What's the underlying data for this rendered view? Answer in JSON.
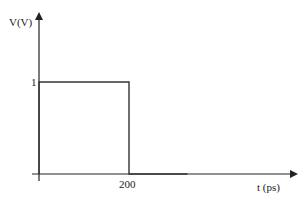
{
  "chart_data": {
    "type": "line",
    "title": "",
    "xlabel": "t (ps)",
    "ylabel": "V(V)",
    "x_ticks": [
      {
        "value": 200,
        "label": "200"
      }
    ],
    "y_ticks": [
      {
        "value": 1,
        "label": "1"
      }
    ],
    "series": [
      {
        "name": "rectangular pulse",
        "x": [
          0,
          0,
          200,
          200,
          330
        ],
        "y": [
          0,
          1,
          1,
          0,
          0
        ]
      }
    ],
    "xlim": [
      0,
      330
    ],
    "ylim": [
      0,
      1.75
    ],
    "grid": false,
    "legend": null,
    "colors": {
      "axis": "#222222",
      "line": "#333333"
    }
  },
  "labels": {
    "y_axis": "V(V)",
    "x_axis": "t (ps)",
    "y_tick_1": "1",
    "x_tick_200": "200"
  }
}
